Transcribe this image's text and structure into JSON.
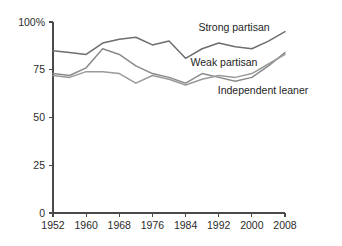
{
  "chart_data": {
    "type": "line",
    "title": "",
    "subtitle": "",
    "xlabel": "",
    "ylabel": "",
    "x": [
      1952,
      1956,
      1960,
      1964,
      1968,
      1972,
      1976,
      1980,
      1984,
      1988,
      1992,
      1996,
      2000,
      2004,
      2008
    ],
    "xlim": [
      1952,
      2008
    ],
    "ylim": [
      0,
      100
    ],
    "xticks": [
      1952,
      1960,
      1968,
      1976,
      1984,
      1992,
      2000,
      2008
    ],
    "xtick_labels": [
      "1952",
      "1960",
      "1968",
      "1976",
      "1984",
      "1992",
      "2000",
      "2008"
    ],
    "yticks": [
      0,
      25,
      50,
      75,
      100
    ],
    "ytick_labels": [
      "0",
      "25",
      "50",
      "75",
      "100%"
    ],
    "grid": false,
    "legend_position": "inline-annotation",
    "series": [
      {
        "name": "Strong partisan",
        "color": "#6e6e6e",
        "values": [
          85,
          84,
          83,
          89,
          91,
          92,
          88,
          90,
          81,
          86,
          89,
          87,
          86,
          90,
          95
        ],
        "label_x": 1992,
        "label_y": 100
      },
      {
        "name": "Weak partisan",
        "color": "#8a8a8a",
        "values": [
          73,
          72,
          76,
          86,
          83,
          77,
          73,
          71,
          68,
          73,
          71,
          69,
          71,
          77,
          84
        ],
        "label_x": 1990,
        "label_y": 83
      },
      {
        "name": "Independent leaner",
        "color": "#9a9a9a",
        "values": [
          72,
          71,
          74,
          74,
          73,
          68,
          72,
          70,
          67,
          70,
          72,
          71,
          73,
          78,
          83
        ],
        "label_x": 1998,
        "label_y": 69
      }
    ]
  }
}
